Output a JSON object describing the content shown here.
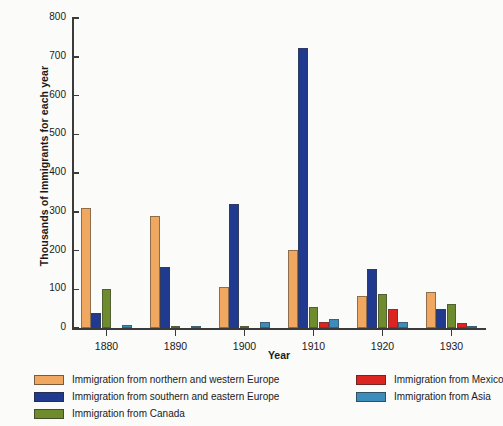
{
  "chart_data": {
    "type": "bar",
    "title": "",
    "xlabel": "Year",
    "ylabel": "Thousands of Immigrants for each year",
    "categories": [
      "1880",
      "1890",
      "1900",
      "1910",
      "1920",
      "1930"
    ],
    "ylim": [
      0,
      800
    ],
    "yticks": [
      0,
      100,
      200,
      300,
      400,
      500,
      600,
      700,
      800
    ],
    "grid": false,
    "legend_position": "bottom",
    "series": [
      {
        "name": "Immigration from northern and western Europe",
        "color": "#F0A860",
        "values": [
          310,
          288,
          105,
          202,
          83,
          93
        ]
      },
      {
        "name": "Immigration from southern and eastern Europe",
        "color": "#1F3A8F",
        "values": [
          38,
          157,
          320,
          723,
          153,
          49
        ]
      },
      {
        "name": "Immigration from Canada",
        "color": "#6E8B2E",
        "values": [
          100,
          2,
          3,
          54,
          88,
          62
        ]
      },
      {
        "name": "Immigration from Mexico",
        "color": "#DC2420",
        "values": [
          0,
          0,
          0,
          16,
          48,
          12
        ]
      },
      {
        "name": "Immigration from Asia",
        "color": "#3C8DBC",
        "values": [
          8,
          3,
          15,
          24,
          15,
          3
        ]
      }
    ]
  },
  "axes": {
    "y_title": "Thousands of Immigrants for each year",
    "x_title": "Year"
  }
}
